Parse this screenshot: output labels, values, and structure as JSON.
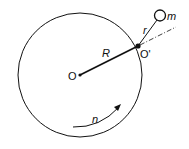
{
  "diagram": {
    "type": "rotating disk with pendulum mass",
    "labels": {
      "center": "O",
      "pivot": "O'",
      "disk_radius": "R",
      "arm_length": "r",
      "mass": "m",
      "rotation_speed": "n"
    },
    "colors": {
      "stroke": "#111111",
      "background": "#ffffff"
    }
  }
}
